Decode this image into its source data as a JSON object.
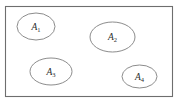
{
  "figure": {
    "name": "venn-style-disjoint-sets-diagram",
    "width": 192,
    "height": 103,
    "background_color": "#ffffff"
  },
  "universe": {
    "name": "universal-set-rectangle",
    "x": 5.5,
    "y": 6.5,
    "width": 167,
    "height": 90,
    "stroke_color": "#6e6e6e",
    "stroke_width": 1.1,
    "fill": "none"
  },
  "sets": [
    {
      "id": "A1",
      "label_base": "A",
      "label_subscript": "1",
      "cx": 36,
      "cy": 26.5,
      "rx": 19,
      "ry": 13.5,
      "label_x": 36,
      "label_y": 29.5,
      "stroke_color": "#8c8c8c"
    },
    {
      "id": "A2",
      "label_base": "A",
      "label_subscript": "2",
      "cx": 112.5,
      "cy": 37,
      "rx": 22.5,
      "ry": 15,
      "label_x": 112.5,
      "label_y": 40,
      "stroke_color": "#8c8c8c"
    },
    {
      "id": "A3",
      "label_base": "A",
      "label_subscript": "3",
      "cx": 51,
      "cy": 71.5,
      "rx": 21,
      "ry": 13.5,
      "label_x": 51,
      "label_y": 74.5,
      "stroke_color": "#8c8c8c"
    },
    {
      "id": "A4",
      "label_base": "A",
      "label_subscript": "4",
      "cx": 139.5,
      "cy": 76.5,
      "rx": 17.5,
      "ry": 11.5,
      "label_x": 139.5,
      "label_y": 79.5,
      "stroke_color": "#8c8c8c"
    }
  ]
}
